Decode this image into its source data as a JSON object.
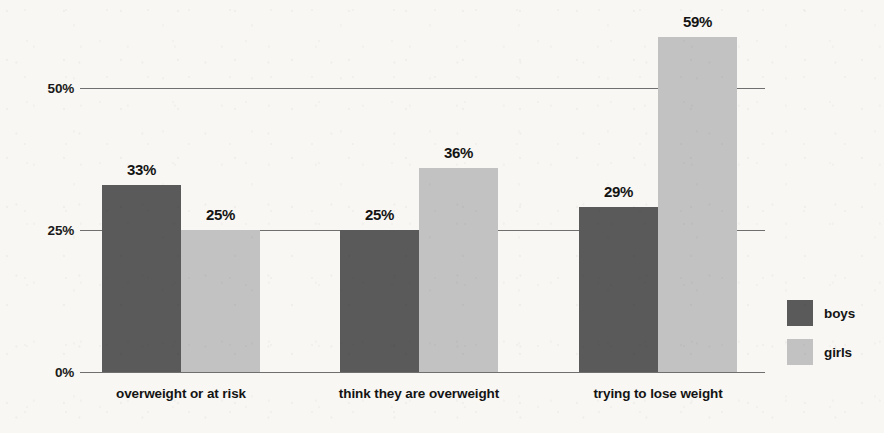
{
  "chart_data": {
    "type": "bar",
    "title": "",
    "subtitle": "",
    "xlabel": "",
    "ylabel": "",
    "categories": [
      "overweight or at risk",
      "think they are overweight",
      "trying to lose weight"
    ],
    "series": [
      {
        "name": "boys",
        "color": "#5a5a5a",
        "values": [
          33,
          25,
          29
        ],
        "labels": [
          "33%",
          "25%",
          "29%"
        ]
      },
      {
        "name": "girls",
        "color": "#c2c2c2",
        "values": [
          25,
          36,
          59
        ],
        "labels": [
          "25%",
          "36%",
          "59%"
        ]
      }
    ],
    "ylim": [
      0,
      50
    ],
    "yticks": [
      0,
      25,
      50
    ],
    "ytick_labels": [
      "0%",
      "25%",
      "50%"
    ],
    "grid": true,
    "legend_position": "right",
    "value_labels": true,
    "orientation": "vertical",
    "grouping": "grouped"
  },
  "axis": {
    "y": {
      "tick_50": "50%",
      "tick_25": "25%",
      "tick_0": "0%"
    }
  },
  "legend": {
    "items": [
      {
        "label": "boys",
        "color": "#5a5a5a"
      },
      {
        "label": "girls",
        "color": "#c2c2c2"
      }
    ]
  },
  "style": {
    "background": "#f8f7f3",
    "axis_color": "#6f6f6f",
    "text_color": "#141414",
    "series_dark": "#5a5a5a",
    "series_light": "#c2c2c2"
  }
}
